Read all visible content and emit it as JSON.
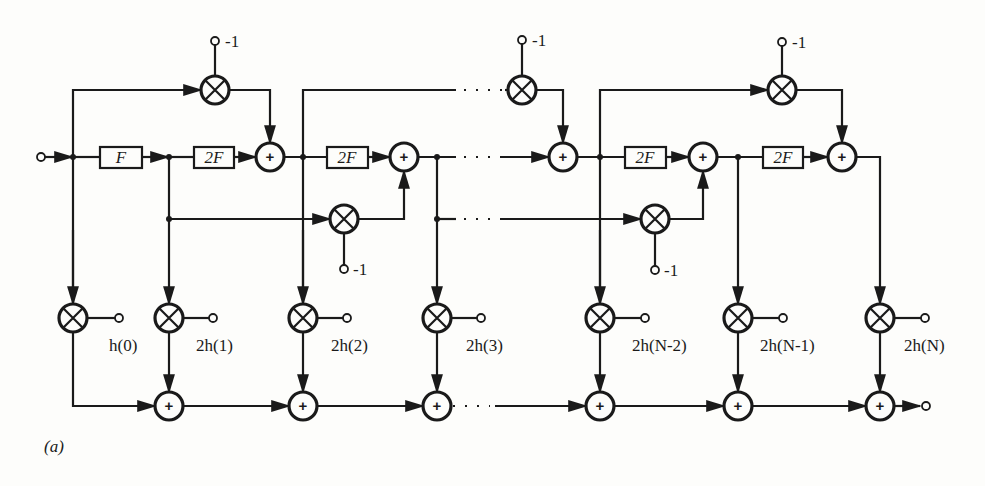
{
  "figure": {
    "caption_label": "(a)",
    "input_terminal": "input",
    "output_terminal": "output"
  },
  "delay_blocks": [
    {
      "label": "F"
    },
    {
      "label": "2F"
    },
    {
      "label": "2F"
    },
    {
      "label": "2F"
    },
    {
      "label": "2F"
    }
  ],
  "negation_constants": [
    "-1",
    "-1",
    "-1",
    "-1",
    "-1"
  ],
  "tap_coefficients": [
    "h(0)",
    "2h(1)",
    "2h(2)",
    "2h(3)",
    "2h(N-2)",
    "2h(N-1)",
    "2h(N)"
  ],
  "symbols": {
    "adder": "+",
    "multiplier": "⊗",
    "ellipsis": "· · ·"
  }
}
